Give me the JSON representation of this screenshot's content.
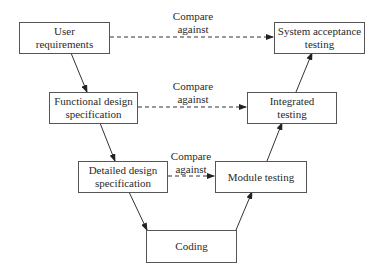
{
  "diagram": {
    "type": "V-model",
    "left_branch": [
      {
        "id": "user_req",
        "lines": [
          "User",
          "requirements"
        ]
      },
      {
        "id": "functional",
        "lines": [
          "Functional design",
          "specification"
        ]
      },
      {
        "id": "detailed",
        "lines": [
          "Detailed design",
          "specification"
        ]
      }
    ],
    "bottom": {
      "id": "coding",
      "lines": [
        "Coding"
      ]
    },
    "right_branch": [
      {
        "id": "module",
        "lines": [
          "Module testing"
        ]
      },
      {
        "id": "integrated",
        "lines": [
          "Integrated",
          "testing"
        ]
      },
      {
        "id": "system",
        "lines": [
          "System acceptance",
          "testing"
        ]
      }
    ],
    "compare_labels": [
      {
        "lines": [
          "Compare",
          "against"
        ]
      },
      {
        "lines": [
          "Compare",
          "against"
        ]
      },
      {
        "lines": [
          "Compare",
          "against"
        ]
      }
    ],
    "edges": [
      {
        "from": "user_req",
        "to": "functional",
        "style": "solid"
      },
      {
        "from": "functional",
        "to": "detailed",
        "style": "solid"
      },
      {
        "from": "detailed",
        "to": "coding",
        "style": "solid"
      },
      {
        "from": "coding",
        "to": "module",
        "style": "solid"
      },
      {
        "from": "module",
        "to": "integrated",
        "style": "solid"
      },
      {
        "from": "integrated",
        "to": "system",
        "style": "solid"
      },
      {
        "from": "user_req",
        "to": "system",
        "style": "dashed",
        "label": "Compare against"
      },
      {
        "from": "functional",
        "to": "integrated",
        "style": "dashed",
        "label": "Compare against"
      },
      {
        "from": "detailed",
        "to": "module",
        "style": "dashed",
        "label": "Compare against"
      }
    ]
  }
}
